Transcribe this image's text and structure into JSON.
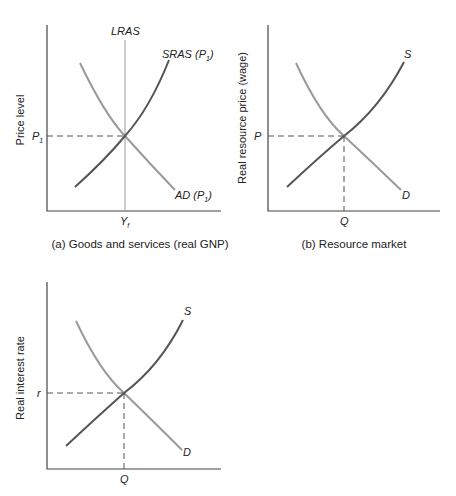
{
  "panels": {
    "a": {
      "caption": "(a) Goods and services (real GNP)",
      "ylabel": "Price level",
      "price_label": "P",
      "price_sub": "1",
      "qty_label": "Y",
      "qty_sub": "f",
      "lras_label": "LRAS",
      "sras_label": "SRAS (P",
      "sras_sub": "1",
      "ad_label": "AD (P",
      "ad_sub": "1",
      "close_paren": ")"
    },
    "b": {
      "caption": "(b) Resource market",
      "ylabel": "Real resource price (wage)",
      "price_label": "P",
      "qty_label": "Q",
      "supply_label": "S",
      "demand_label": "D"
    },
    "c": {
      "caption": "",
      "ylabel": "Real interest rate",
      "price_label": "r",
      "qty_label": "Q",
      "supply_label": "S",
      "demand_label": "D"
    }
  },
  "colors": {
    "supply": "#555555",
    "demand": "#9a9a9a",
    "axis": "#444444"
  }
}
